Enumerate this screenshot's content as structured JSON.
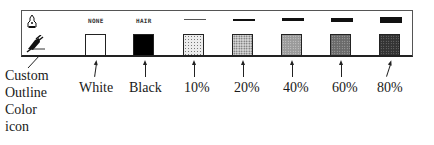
{
  "panel": {
    "pen_icon": "pen-nib-icon",
    "custom_icon": "custom-outline-color-icon",
    "headers": [
      "NONE",
      "HAIR"
    ],
    "line_weights": [
      1,
      2,
      3,
      4,
      6
    ],
    "swatches": [
      {
        "name": "white",
        "fill": "#ffffff",
        "label": "White"
      },
      {
        "name": "black",
        "fill": "#000000",
        "label": "Black"
      },
      {
        "name": "10",
        "fill": "#e6e6e6",
        "label": "10%"
      },
      {
        "name": "20",
        "fill": "#c8c8c8",
        "label": "20%"
      },
      {
        "name": "40",
        "fill": "#9a9a9a",
        "label": "40%"
      },
      {
        "name": "60",
        "fill": "#6e6e6e",
        "label": "60%"
      },
      {
        "name": "80",
        "fill": "#3c3c3c",
        "label": "80%"
      }
    ]
  },
  "callout": {
    "lines": [
      "Custom",
      "Outline",
      "Color",
      "icon"
    ]
  }
}
